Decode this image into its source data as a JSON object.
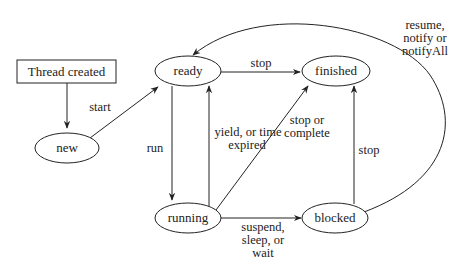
{
  "diagram": {
    "type": "state-diagram",
    "colors": {
      "stroke": "#222222",
      "text": "#222222",
      "background": "#ffffff"
    },
    "nodes": {
      "thread_created": {
        "label": "Thread created",
        "shape": "rectangle"
      },
      "new": {
        "label": "new",
        "shape": "ellipse"
      },
      "ready": {
        "label": "ready",
        "shape": "ellipse"
      },
      "finished": {
        "label": "finished",
        "shape": "ellipse"
      },
      "running": {
        "label": "running",
        "shape": "ellipse"
      },
      "blocked": {
        "label": "blocked",
        "shape": "ellipse"
      }
    },
    "edges": {
      "created_to_new": {
        "from": "Thread created",
        "to": "new",
        "label": ""
      },
      "start": {
        "from": "new",
        "to": "ready",
        "label": "start"
      },
      "ready_stop": {
        "from": "ready",
        "to": "finished",
        "label": "stop"
      },
      "run": {
        "from": "ready",
        "to": "running",
        "label": "run"
      },
      "yield": {
        "from": "running",
        "to": "ready",
        "label_lines": [
          "yield, or time",
          "expired"
        ]
      },
      "stop_or_complete": {
        "from": "running",
        "to": "finished",
        "label_lines": [
          "stop or",
          "complete"
        ]
      },
      "suspend": {
        "from": "running",
        "to": "blocked",
        "label_lines": [
          "suspend,",
          "sleep, or",
          "wait"
        ]
      },
      "blocked_stop": {
        "from": "blocked",
        "to": "finished",
        "label": "stop"
      },
      "resume": {
        "from": "blocked",
        "to": "ready",
        "label_lines": [
          "resume,",
          "notify or",
          "notifyAll"
        ]
      }
    }
  }
}
